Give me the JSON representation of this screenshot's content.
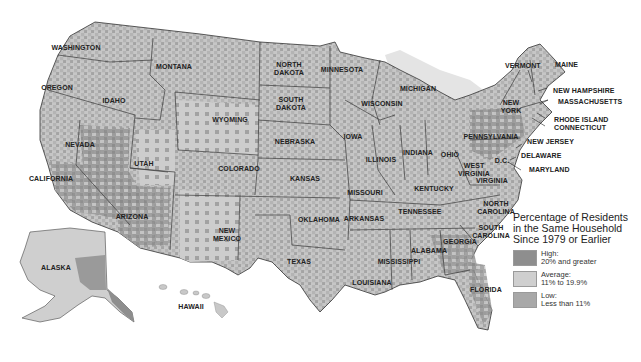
{
  "map": {
    "colors": {
      "high": "#8e8e8e",
      "average": "#cfcfcf",
      "low": "#a8a8a8",
      "border": "#3a3a3a",
      "water": "#e2e2e2",
      "background": "#ffffff"
    },
    "states": [
      {
        "name": "WASHINGTON",
        "x": 76,
        "y": 48
      },
      {
        "name": "OREGON",
        "x": 57,
        "y": 88
      },
      {
        "name": "IDAHO",
        "x": 114,
        "y": 101
      },
      {
        "name": "MONTANA",
        "x": 174,
        "y": 67
      },
      {
        "name": "WYOMING",
        "x": 230,
        "y": 120
      },
      {
        "name": "NORTH\nDAKOTA",
        "x": 289,
        "y": 69
      },
      {
        "name": "SOUTH\nDAKOTA",
        "x": 291,
        "y": 104
      },
      {
        "name": "MINNESOTA",
        "x": 342,
        "y": 70
      },
      {
        "name": "WISCONSIN",
        "x": 382,
        "y": 104
      },
      {
        "name": "MICHIGAN",
        "x": 418,
        "y": 89
      },
      {
        "name": "NEVADA",
        "x": 80,
        "y": 145
      },
      {
        "name": "CALIFORNIA",
        "x": 51,
        "y": 179
      },
      {
        "name": "UTAH",
        "x": 144,
        "y": 164
      },
      {
        "name": "COLORADO",
        "x": 239,
        "y": 169
      },
      {
        "name": "NEBRASKA",
        "x": 295,
        "y": 142
      },
      {
        "name": "IOWA",
        "x": 353,
        "y": 137
      },
      {
        "name": "ILLINOIS",
        "x": 381,
        "y": 160
      },
      {
        "name": "INDIANA",
        "x": 418,
        "y": 153
      },
      {
        "name": "OHIO",
        "x": 450,
        "y": 155
      },
      {
        "name": "KANSAS",
        "x": 305,
        "y": 179
      },
      {
        "name": "MISSOURI",
        "x": 365,
        "y": 193
      },
      {
        "name": "KENTUCKY",
        "x": 434,
        "y": 189
      },
      {
        "name": "ARIZONA",
        "x": 132,
        "y": 217
      },
      {
        "name": "NEW\nMEXICO",
        "x": 227,
        "y": 235
      },
      {
        "name": "OKLAHOMA",
        "x": 319,
        "y": 220
      },
      {
        "name": "ARKANSAS",
        "x": 364,
        "y": 219
      },
      {
        "name": "TENNESSEE",
        "x": 420,
        "y": 212
      },
      {
        "name": "TEXAS",
        "x": 299,
        "y": 262
      },
      {
        "name": "LOUISIANA",
        "x": 372,
        "y": 283
      },
      {
        "name": "MISSISSIPPI",
        "x": 399,
        "y": 262
      },
      {
        "name": "ALABAMA",
        "x": 429,
        "y": 251
      },
      {
        "name": "GEORGIA",
        "x": 460,
        "y": 242
      },
      {
        "name": "FLORIDA",
        "x": 486,
        "y": 290
      },
      {
        "name": "SOUTH\nCAROLINA",
        "x": 491,
        "y": 232
      },
      {
        "name": "NORTH\nCAROLINA",
        "x": 496,
        "y": 208
      },
      {
        "name": "VIRGINIA",
        "x": 492,
        "y": 181
      },
      {
        "name": "WEST\nVIRGINIA",
        "x": 474,
        "y": 170
      },
      {
        "name": "PENNSYLVANIA",
        "x": 491,
        "y": 137
      },
      {
        "name": "NEW\nYORK",
        "x": 511,
        "y": 107
      },
      {
        "name": "D.C.",
        "x": 502,
        "y": 161
      },
      {
        "name": "ALASKA",
        "x": 56,
        "y": 268
      },
      {
        "name": "HAWAII",
        "x": 191,
        "y": 307
      }
    ],
    "callout_labels": [
      {
        "name": "VERMONT",
        "x": 505,
        "y": 66
      },
      {
        "name": "MAINE",
        "x": 555,
        "y": 65
      },
      {
        "name": "NEW HAMPSHIRE",
        "x": 553,
        "y": 91
      },
      {
        "name": "MASSACHUSETTS",
        "x": 558,
        "y": 102
      },
      {
        "name": "RHODE ISLAND",
        "x": 554,
        "y": 120
      },
      {
        "name": "CONNECTICUT",
        "x": 554,
        "y": 128
      },
      {
        "name": "NEW JERSEY",
        "x": 527,
        "y": 142
      },
      {
        "name": "DELAWARE",
        "x": 521,
        "y": 156
      },
      {
        "name": "MARYLAND",
        "x": 529,
        "y": 170
      }
    ]
  },
  "legend": {
    "title": "Percentage of Residents in the Same Household Since 1979 or Earlier",
    "title_lines": [
      "Percentage of Residents",
      "in the Same Household",
      "Since 1979 or Earlier"
    ],
    "items": [
      {
        "label": "High:",
        "range": "20% and greater",
        "color": "#8e8e8e"
      },
      {
        "label": "Average:",
        "range": "11% to 19.9%",
        "color": "#cfcfcf"
      },
      {
        "label": "Low:",
        "range": "Less than 11%",
        "color": "#a8a8a8"
      }
    ]
  }
}
